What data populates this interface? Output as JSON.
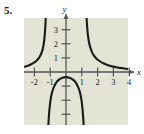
{
  "figure": {
    "problem_number": "5.",
    "background_color": "#e3e4d5",
    "curve_color": "#1a1a1a",
    "axis_color": "#555555"
  },
  "chart_data": {
    "type": "line",
    "title": "",
    "xlabel": "x",
    "ylabel": "y",
    "xlim": [
      -2.6,
      4.3
    ],
    "ylim": [
      -3.8,
      3.9
    ],
    "grid": false,
    "legend": null,
    "x_ticks": [
      -2,
      -1,
      1,
      2,
      3,
      4
    ],
    "x_tick_labels": [
      "-2",
      "-1",
      "1",
      "2",
      "3",
      "4"
    ],
    "y_ticks": [
      1,
      2,
      3
    ],
    "y_tick_labels": [
      "1",
      "2",
      "3"
    ],
    "y_unlabeled_ticks": [
      -1,
      -2,
      -3
    ],
    "asymptotes": {
      "vertical": [
        -1.25,
        1.25
      ],
      "horizontal": [
        0
      ]
    },
    "series": [
      {
        "name": "left-branch",
        "comment": "rises from y~0.4 at x=-2.6 up to +infinity as x -> -1.25 from the left",
        "points": [
          [
            -2.6,
            0.38
          ],
          [
            -2.4,
            0.45
          ],
          [
            -2.2,
            0.55
          ],
          [
            -2.0,
            0.68
          ],
          [
            -1.85,
            0.82
          ],
          [
            -1.7,
            1.02
          ],
          [
            -1.6,
            1.22
          ],
          [
            -1.5,
            1.52
          ],
          [
            -1.43,
            1.85
          ],
          [
            -1.38,
            2.25
          ],
          [
            -1.34,
            2.7
          ],
          [
            -1.31,
            3.2
          ],
          [
            -1.29,
            3.6
          ],
          [
            -1.28,
            3.9
          ]
        ]
      },
      {
        "name": "middle-branch",
        "comment": "inverted U below x-axis, peak near (0,-0.35), falls to -infinity near x = -1.25 and x = 1.25",
        "points": [
          [
            -1.12,
            -3.8
          ],
          [
            -1.08,
            -3.1
          ],
          [
            -1.03,
            -2.45
          ],
          [
            -0.96,
            -1.85
          ],
          [
            -0.86,
            -1.35
          ],
          [
            -0.74,
            -1.0
          ],
          [
            -0.6,
            -0.72
          ],
          [
            -0.44,
            -0.54
          ],
          [
            -0.26,
            -0.42
          ],
          [
            0.0,
            -0.36
          ],
          [
            0.26,
            -0.42
          ],
          [
            0.44,
            -0.54
          ],
          [
            0.6,
            -0.72
          ],
          [
            0.74,
            -1.0
          ],
          [
            0.86,
            -1.35
          ],
          [
            0.96,
            -1.85
          ],
          [
            1.03,
            -2.45
          ],
          [
            1.08,
            -3.1
          ],
          [
            1.12,
            -3.8
          ]
        ]
      },
      {
        "name": "right-branch",
        "comment": "drops from +infinity near x = 1.25 and decays toward y = 0 as x -> 4.3",
        "points": [
          [
            1.3,
            3.9
          ],
          [
            1.32,
            3.5
          ],
          [
            1.35,
            3.05
          ],
          [
            1.39,
            2.6
          ],
          [
            1.45,
            2.15
          ],
          [
            1.53,
            1.78
          ],
          [
            1.63,
            1.45
          ],
          [
            1.76,
            1.18
          ],
          [
            1.92,
            0.96
          ],
          [
            2.12,
            0.78
          ],
          [
            2.36,
            0.62
          ],
          [
            2.62,
            0.5
          ],
          [
            2.92,
            0.4
          ],
          [
            3.25,
            0.32
          ],
          [
            3.6,
            0.26
          ],
          [
            3.95,
            0.21
          ],
          [
            4.3,
            0.18
          ]
        ]
      }
    ]
  }
}
